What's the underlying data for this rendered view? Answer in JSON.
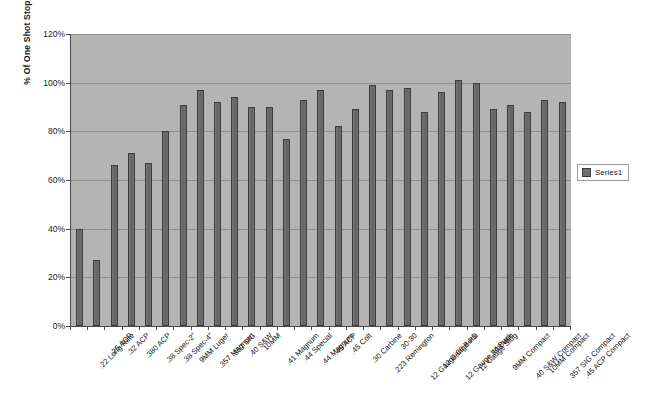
{
  "chart_data": {
    "type": "bar",
    "title": "",
    "xlabel": "",
    "ylabel": "% Of One Shot Stops",
    "ylim": [
      0,
      120
    ],
    "ytick_step": 20,
    "ytick_labels": [
      "0%",
      "20%",
      "40%",
      "60%",
      "80%",
      "100%",
      "120%"
    ],
    "grid": true,
    "legend": {
      "position": "right",
      "entries": [
        "Series1"
      ]
    },
    "series": [
      {
        "name": "Series1",
        "values": [
          40,
          27,
          66,
          71,
          67,
          80,
          91,
          97,
          92,
          94,
          90,
          90,
          77,
          93,
          97,
          82,
          89,
          99,
          97,
          98,
          88,
          96,
          101,
          100,
          89,
          91,
          88,
          93,
          92
        ]
      }
    ],
    "categories": [
      ".22 Long Rifle",
      ".25 ACP",
      ".32 ACP",
      ".380 ACP",
      ".38 Spec-2\"",
      ".38 Spec-4\"",
      "9MM Luger",
      ".357 Magnum",
      ".357 SIG",
      ".40 S&W",
      "10MM",
      ".41 Magnum",
      ".44 Special",
      ".44 Magnum",
      ".45 ACP",
      ".45 Colt",
      ".30 Carbine",
      ".223 Remington",
      "30-30",
      "12 Gauge-00 Buck",
      "12 Gauge-PD",
      "12 Gauge #4 Buck",
      "12 Gauge Slug",
      ".308 Win",
      "9MM Compact",
      ".40 S&W Compact",
      "10MM Compact",
      ".357 SIG Compact",
      ".45 ACP Compact"
    ]
  },
  "legend": {
    "series1_label": "Series1"
  },
  "axes": {
    "y_title": "% Of One Shot Stops"
  }
}
